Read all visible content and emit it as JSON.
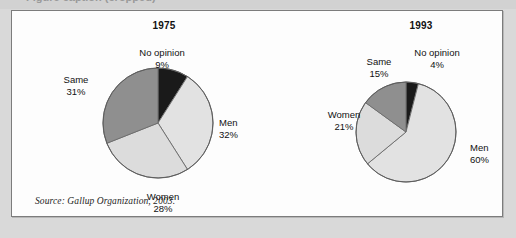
{
  "figure": {
    "source_note": "Source: Gallup Organization, 2003.",
    "top_ghost_text": "Figure caption (cropped)"
  },
  "chart_data": [
    {
      "type": "pie",
      "title": "1975",
      "categories": [
        "No opinion",
        "Men",
        "Women",
        "Same"
      ],
      "values": [
        9,
        32,
        28,
        31
      ],
      "labels": [
        "9%",
        "32%",
        "28%",
        "31%"
      ],
      "colors": [
        "#1a1a1a",
        "#e2e2e2",
        "#dcdcdc",
        "#8f8f8f"
      ],
      "start_angle": 0,
      "direction": "clockwise",
      "legend": "callout-labels",
      "grid": false
    },
    {
      "type": "pie",
      "title": "1993",
      "categories": [
        "No opinion",
        "Men",
        "Women",
        "Same"
      ],
      "values": [
        4,
        60,
        21,
        15
      ],
      "labels": [
        "4%",
        "60%",
        "21%",
        "15%"
      ],
      "colors": [
        "#1a1a1a",
        "#e2e2e2",
        "#dcdcdc",
        "#8f8f8f"
      ],
      "start_angle": 0,
      "direction": "clockwise",
      "legend": "callout-labels",
      "grid": false
    }
  ],
  "pie_1975": {
    "title": "1975",
    "no_opinion_name": "No opinion",
    "no_opinion_pct": "9%",
    "same_name": "Same",
    "same_pct": "31%",
    "men_name": "Men",
    "men_pct": "32%",
    "women_name": "Women",
    "women_pct": "28%"
  },
  "pie_1993": {
    "title": "1993",
    "no_opinion_name": "No opinion",
    "no_opinion_pct": "4%",
    "same_name": "Same",
    "same_pct": "15%",
    "men_name": "Men",
    "men_pct": "60%",
    "women_name": "Women",
    "women_pct": "21%"
  }
}
